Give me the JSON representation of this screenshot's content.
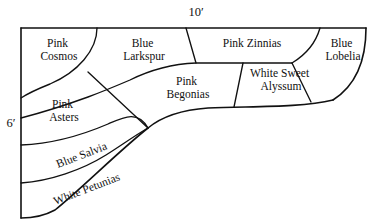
{
  "diagram": {
    "type": "garden-bed-layout",
    "dimensions": {
      "width_label": "10′",
      "height_label": "6′",
      "width_value": 10,
      "height_value": 6,
      "units": "feet"
    },
    "beds": [
      {
        "id": "pink-cosmos",
        "line1": "Pink",
        "line2": "Cosmos",
        "full": "Pink Cosmos",
        "rotation": 0,
        "x": 59,
        "y": 50
      },
      {
        "id": "blue-larkspur",
        "line1": "Blue",
        "line2": "Larkspur",
        "full": "Blue Larkspur",
        "rotation": 0,
        "x": 144,
        "y": 50
      },
      {
        "id": "pink-zinnias",
        "line1": "Pink Zinnias",
        "line2": "",
        "full": "Pink Zinnias",
        "rotation": 0,
        "x": 252,
        "y": 44
      },
      {
        "id": "blue-lobelia",
        "line1": "Blue",
        "line2": "Lobelia",
        "full": "Blue Lobelia",
        "rotation": 0,
        "x": 341,
        "y": 50
      },
      {
        "id": "pink-begonias",
        "line1": "Pink",
        "line2": "Begonias",
        "full": "Pink Begonias",
        "rotation": 0,
        "x": 188,
        "y": 88
      },
      {
        "id": "white-sweet-alyssum",
        "line1": "White Sweet",
        "line2": "Alyssum",
        "full": "White Sweet Alyssum",
        "rotation": 0,
        "x": 281,
        "y": 80
      },
      {
        "id": "pink-asters",
        "line1": "Pink",
        "line2": "Asters",
        "full": "Pink Asters",
        "rotation": 0,
        "x": 64,
        "y": 111
      },
      {
        "id": "blue-salvia",
        "line1": "Blue Salvia",
        "line2": "",
        "full": "Blue Salvia",
        "rotation": -21,
        "x": 82,
        "y": 156
      },
      {
        "id": "white-petunias",
        "line1": "White Petunias",
        "line2": "",
        "full": "White Petunias",
        "rotation": -21,
        "x": 85,
        "y": 189
      }
    ],
    "colors": {
      "stroke": "#111111",
      "background": "#ffffff",
      "text": "#111111"
    }
  }
}
